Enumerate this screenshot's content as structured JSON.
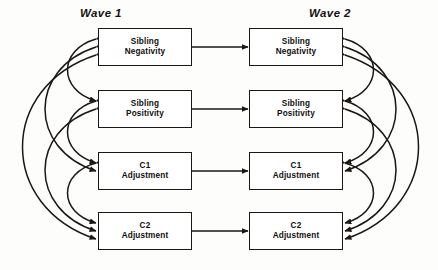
{
  "figure": {
    "type": "cross-lagged-panel-diagram",
    "background_color": "#fdfdfc",
    "line_color": "#1a1714",
    "box_fill": "#ffffff"
  },
  "waves": {
    "wave1": {
      "label": "Wave 1"
    },
    "wave2": {
      "label": "Wave 2"
    }
  },
  "constructs": [
    {
      "id": "sibling-negativity",
      "label": "Sibling\nNegativity"
    },
    {
      "id": "sibling-positivity",
      "label": "Sibling\nPositivity"
    },
    {
      "id": "c1-adjustment",
      "label": "C1\nAdjustment"
    },
    {
      "id": "c2-adjustment",
      "label": "C2\nAdjustment"
    }
  ],
  "nodes": {
    "wave1": [
      {
        "id": "w1-sibling-negativity",
        "label": "Sibling\nNegativity",
        "x": 98,
        "y": 28,
        "w": 94,
        "h": 38
      },
      {
        "id": "w1-sibling-positivity",
        "label": "Sibling\nPositivity",
        "x": 98,
        "y": 90,
        "w": 94,
        "h": 38
      },
      {
        "id": "w1-c1-adjustment",
        "label": "C1\nAdjustment",
        "x": 98,
        "y": 152,
        "w": 94,
        "h": 38
      },
      {
        "id": "w1-c2-adjustment",
        "label": "C2\nAdjustment",
        "x": 98,
        "y": 212,
        "w": 94,
        "h": 38
      }
    ],
    "wave2": [
      {
        "id": "w2-sibling-negativity",
        "label": "Sibling\nNegativity",
        "x": 249,
        "y": 28,
        "w": 94,
        "h": 38
      },
      {
        "id": "w2-sibling-positivity",
        "label": "Sibling\nPositivity",
        "x": 249,
        "y": 90,
        "w": 94,
        "h": 38
      },
      {
        "id": "w2-c1-adjustment",
        "label": "C1\nAdjustment",
        "x": 249,
        "y": 152,
        "w": 94,
        "h": 38
      },
      {
        "id": "w2-c2-adjustment",
        "label": "C2\nAdjustment",
        "x": 249,
        "y": 212,
        "w": 94,
        "h": 38
      }
    ]
  },
  "stability_paths": [
    {
      "id": "path-sibling-negativity",
      "from": "w1-sibling-negativity",
      "to": "w2-sibling-negativity",
      "y": 47
    },
    {
      "id": "path-sibling-positivity",
      "from": "w1-sibling-positivity",
      "to": "w2-sibling-positivity",
      "y": 109
    },
    {
      "id": "path-c1-adjustment",
      "from": "w1-c1-adjustment",
      "to": "w2-c1-adjustment",
      "y": 171
    },
    {
      "id": "path-c2-adjustment",
      "from": "w1-c2-adjustment",
      "to": "w2-c2-adjustment",
      "y": 231
    }
  ],
  "correlation_arcs": {
    "wave1_side": "left",
    "wave2_side": "right",
    "pairs": [
      {
        "id": "corr-neg-pos",
        "a": 0,
        "b": 1,
        "depth": 1
      },
      {
        "id": "corr-pos-c1",
        "a": 1,
        "b": 2,
        "depth": 1
      },
      {
        "id": "corr-c1-c2",
        "a": 2,
        "b": 3,
        "depth": 1
      },
      {
        "id": "corr-neg-c1",
        "a": 0,
        "b": 2,
        "depth": 2
      },
      {
        "id": "corr-pos-c2",
        "a": 1,
        "b": 3,
        "depth": 2
      },
      {
        "id": "corr-neg-c2",
        "a": 0,
        "b": 3,
        "depth": 3
      }
    ]
  }
}
